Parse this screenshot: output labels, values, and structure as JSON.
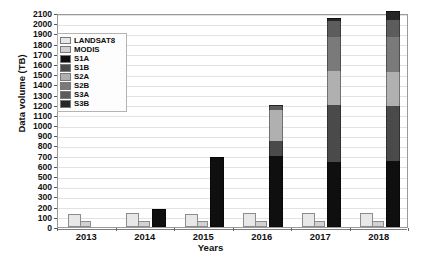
{
  "chart_data": {
    "type": "bar",
    "subtype": "stacked-bar-grouped",
    "title": "",
    "xlabel": "Years",
    "ylabel": "Data volume (TB)",
    "categories": [
      "2013",
      "2014",
      "2015",
      "2016",
      "2017",
      "2018"
    ],
    "ylim": [
      0,
      2100
    ],
    "ytick_step": 100,
    "yticks": [
      2100,
      2000,
      1900,
      1800,
      1700,
      1600,
      1500,
      1400,
      1300,
      1200,
      1100,
      1000,
      900,
      800,
      700,
      600,
      500,
      400,
      300,
      200,
      100,
      0
    ],
    "grid": true,
    "legend_position": "upper-left-inside",
    "series": [
      {
        "name": "LANDSAT8",
        "color": "#e8e8e8",
        "values": [
          130,
          135,
          130,
          135,
          140,
          140
        ]
      },
      {
        "name": "MODIS",
        "color": "#d2d2d2",
        "values": [
          55,
          60,
          55,
          60,
          60,
          60
        ]
      },
      {
        "name": "S1A",
        "color": "#0f0f0f",
        "values": [
          0,
          180,
          690,
          700,
          640,
          650
        ]
      },
      {
        "name": "S1B",
        "color": "#4a4a4a",
        "values": [
          0,
          0,
          0,
          140,
          560,
          540
        ]
      },
      {
        "name": "S2A",
        "color": "#b0b0b0",
        "values": [
          0,
          0,
          0,
          310,
          330,
          330
        ]
      },
      {
        "name": "S2B",
        "color": "#7a7a7a",
        "values": [
          0,
          0,
          0,
          0,
          330,
          340
        ]
      },
      {
        "name": "S3A",
        "color": "#5c5c5c",
        "values": [
          0,
          0,
          0,
          50,
          160,
          170
        ]
      },
      {
        "name": "S3B",
        "color": "#262626",
        "values": [
          0,
          0,
          0,
          0,
          30,
          90
        ]
      }
    ],
    "stack_order": [
      "S1A",
      "S1B",
      "S2A",
      "S2B",
      "S3A",
      "S3B"
    ],
    "side_bars": [
      "LANDSAT8",
      "MODIS"
    ],
    "stack_totals": [
      0,
      180,
      690,
      1200,
      2050,
      2120
    ]
  },
  "legend": {
    "items": [
      {
        "label": "LANDSAT8",
        "color": "#e8e8e8"
      },
      {
        "label": "MODIS",
        "color": "#d2d2d2"
      },
      {
        "label": "S1A",
        "color": "#0f0f0f"
      },
      {
        "label": "S1B",
        "color": "#4a4a4a"
      },
      {
        "label": "S2A",
        "color": "#b0b0b0"
      },
      {
        "label": "S2B",
        "color": "#7a7a7a"
      },
      {
        "label": "S3A",
        "color": "#5c5c5c"
      },
      {
        "label": "S3B",
        "color": "#262626"
      }
    ]
  },
  "axes": {
    "y_title": "Data volume (TB)",
    "x_title": "Years"
  }
}
